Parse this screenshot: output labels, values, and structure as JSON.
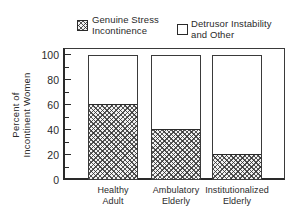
{
  "figure": {
    "background": "#ffffff",
    "ink": "#2a2a2a"
  },
  "legend": {
    "position": "top",
    "items": [
      {
        "id": "genuine-stress",
        "swatch": "diagonal-crosshatch",
        "lines": [
          "Genuine Stress",
          "Incontinence"
        ]
      },
      {
        "id": "detrusor-other",
        "swatch": "open-white",
        "lines": [
          "Detrusor Instability",
          "and Other"
        ]
      }
    ]
  },
  "chart_data": {
    "type": "bar",
    "stacked": true,
    "title": "",
    "categories": [
      "Healthy Adult",
      "Ambulatory Elderly",
      "Institutionalized Elderly"
    ],
    "category_label_lines": [
      [
        "Healthy",
        "Adult"
      ],
      [
        "Ambulatory",
        "Elderly"
      ],
      [
        "Institutionalized",
        "Elderly"
      ]
    ],
    "series": [
      {
        "name": "Genuine Stress Incontinence",
        "values": [
          60,
          40,
          20
        ],
        "fill": "diagonal-crosshatch"
      },
      {
        "name": "Detrusor Instability and Other",
        "values": [
          40,
          60,
          80
        ],
        "fill": "white-open"
      }
    ],
    "ylabel": "Percent of Incontinent Women",
    "ylabel_lines": [
      "Percent of",
      "Incontinent Women"
    ],
    "xlabel": "",
    "yticks": [
      0,
      20,
      40,
      60,
      80,
      100
    ],
    "minor_tick_step": 10,
    "ylim": [
      0,
      106
    ],
    "grid": false,
    "legend_position": "top"
  }
}
